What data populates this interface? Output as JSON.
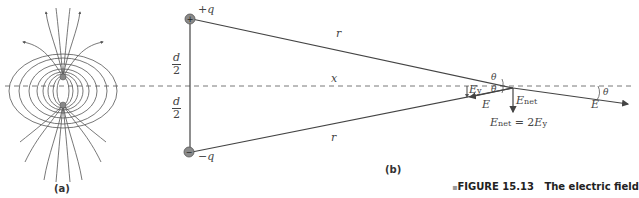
{
  "figure": {
    "caption_prefix": "FIGURE 15.13",
    "caption_text": "The electric field",
    "bullet": "▪"
  },
  "panel_a": {
    "label": "(a)",
    "description": "Electric field lines of an electric dipole"
  },
  "panel_b": {
    "label": "(b)",
    "charges": {
      "positive": "+q",
      "negative": "−q",
      "positive_symbol": "+",
      "negative_symbol": "−"
    },
    "distances": {
      "half_sep_num": "d",
      "half_sep_den": "2",
      "r_top": "r",
      "r_bottom": "r",
      "x": "x"
    },
    "angles": {
      "theta_top": "θ",
      "theta_bottom": "θ",
      "theta_right": "θ"
    },
    "vectors": {
      "E_left": "E",
      "E_right": "E",
      "Ey_main": "E",
      "Ey_sub": "y",
      "Enet_main": "E",
      "Enet_sub": "net",
      "equation_lhs_main": "E",
      "equation_lhs_sub": "net",
      "equation_eq": " = 2",
      "equation_rhs_main": "E",
      "equation_rhs_sub": "y"
    }
  },
  "colors": {
    "line": "#444444",
    "charge_fill": "#8a8a8a",
    "text": "#444444"
  }
}
